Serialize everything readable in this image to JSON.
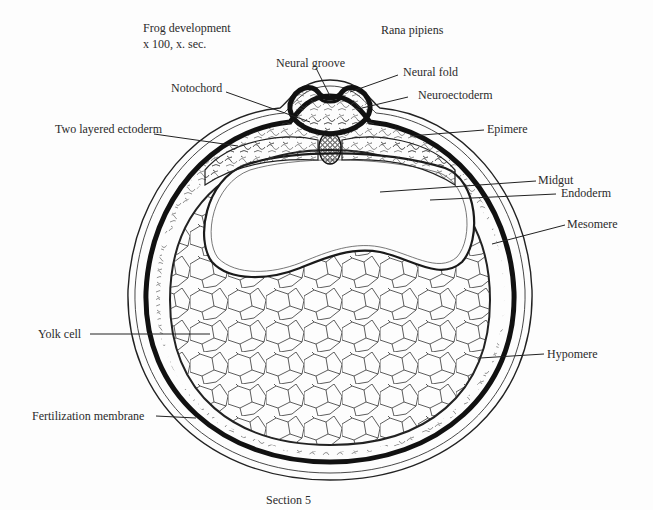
{
  "header": {
    "title_line1": "Frog development",
    "title_line2": "x 100, x. sec.",
    "species": "Rana pipiens"
  },
  "labels": {
    "neural_groove": "Neural groove",
    "neural_fold": "Neural fold",
    "notochord": "Notochord",
    "neuroectoderm": "Neuroectoderm",
    "two_layered_ectoderm": "Two layered ectoderm",
    "epimere": "Epimere",
    "midgut": "Midgut",
    "endoderm": "Endoderm",
    "mesomere": "Mesomere",
    "yolk_cell": "Yolk cell",
    "hypomere": "Hypomere",
    "fertilization_membrane": "Fertilization membrane"
  },
  "caption": "Section 5",
  "colors": {
    "ink": "#1a1a1a",
    "paper": "#fdfdfd"
  }
}
